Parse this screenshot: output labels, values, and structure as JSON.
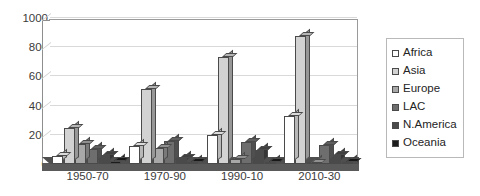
{
  "chart_data": {
    "type": "bar",
    "title": "",
    "xlabel": "",
    "ylabel": "",
    "ylim": [
      0,
      1000
    ],
    "ytick_values": [
      1000,
      800,
      600,
      400,
      200,
      0
    ],
    "ytick_labels": [
      "1000",
      "800",
      "600",
      "400",
      "200",
      "0"
    ],
    "grid": true,
    "legend_position": "right",
    "style": "3d-column",
    "categories": [
      "1950-70",
      "1970-90",
      "1990-10",
      "2010-30"
    ],
    "series": [
      {
        "name": "Africa",
        "color": "#ffffff",
        "values": [
          55,
          125,
          200,
          330
        ]
      },
      {
        "name": "Asia",
        "color": "#d2d2d2",
        "values": [
          245,
          515,
          735,
          880
        ]
      },
      {
        "name": "Europe",
        "color": "#a8a8a8",
        "values": [
          140,
          110,
          35,
          10
        ]
      },
      {
        "name": "LAC",
        "color": "#6e6e6e",
        "values": [
          100,
          160,
          150,
          130
        ]
      },
      {
        "name": "N.America",
        "color": "#4a4a4a",
        "values": [
          65,
          40,
          95,
          65
        ]
      },
      {
        "name": "Oceania",
        "color": "#1c1c1c",
        "values": [
          20,
          15,
          15,
          12
        ]
      }
    ]
  },
  "legend": {
    "entries": [
      {
        "label": "Africa"
      },
      {
        "label": "Asia"
      },
      {
        "label": "Europe"
      },
      {
        "label": "LAC"
      },
      {
        "label": "N.America"
      },
      {
        "label": "Oceania"
      }
    ]
  }
}
